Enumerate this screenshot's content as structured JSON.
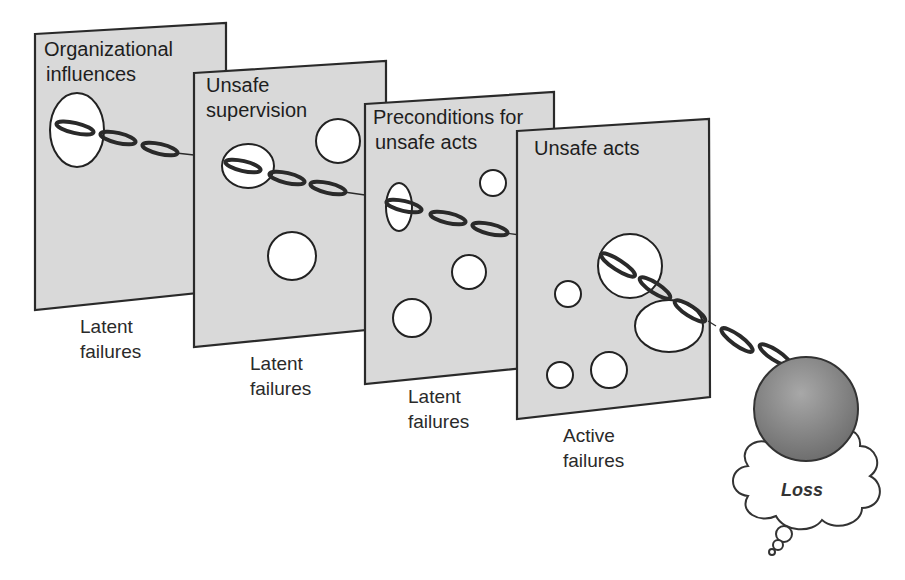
{
  "diagram": {
    "type": "swiss-cheese-model",
    "layers": [
      {
        "id": "organizational",
        "title_lines": [
          "Organizational",
          "influences"
        ],
        "caption_lines": [
          "Latent",
          "failures"
        ]
      },
      {
        "id": "supervision",
        "title_lines": [
          "Unsafe",
          "supervision"
        ],
        "caption_lines": [
          "Latent",
          "failures"
        ]
      },
      {
        "id": "preconditions",
        "title_lines": [
          "Preconditions for",
          "unsafe acts"
        ],
        "caption_lines": [
          "Latent",
          "failures"
        ]
      },
      {
        "id": "unsafe-acts",
        "title_lines": [
          "Unsafe acts"
        ],
        "caption_lines": [
          "Active",
          "failures"
        ]
      }
    ],
    "outcome": {
      "label": "Loss"
    },
    "colors": {
      "panel_fill": "#d9d9d9",
      "panel_stroke": "#2a2a2a",
      "hole_fill": "#ffffff",
      "ball_dark": "#6e6e6e",
      "ball_light": "#a8a8a8"
    }
  }
}
